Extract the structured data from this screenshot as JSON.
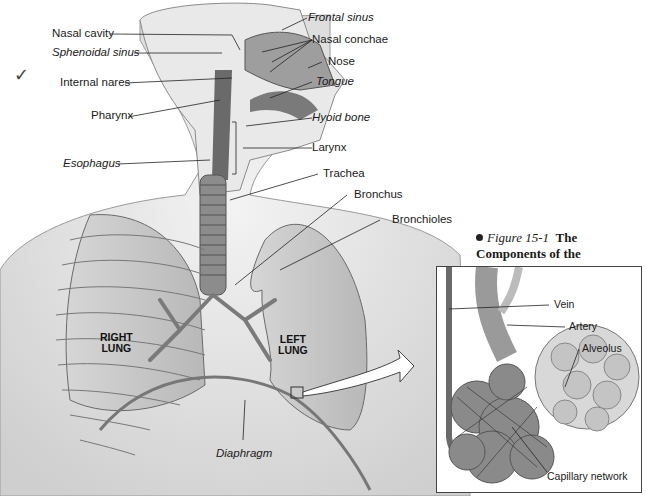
{
  "figure": {
    "bullet": "•",
    "number": "Figure 15-1",
    "title": "The Components of the Respiratory System"
  },
  "annotation": {
    "check_mark": "✓"
  },
  "labels_left": [
    {
      "id": "nasal-cavity",
      "text": "Nasal cavity",
      "italic": false
    },
    {
      "id": "sphenoidal-sinus",
      "text": "Sphenoidal sinus",
      "italic": true
    },
    {
      "id": "internal-nares",
      "text": "Internal nares",
      "italic": false
    },
    {
      "id": "pharynx",
      "text": "Pharynx",
      "italic": false
    },
    {
      "id": "esophagus",
      "text": "Esophagus",
      "italic": true
    }
  ],
  "labels_right": [
    {
      "id": "frontal-sinus",
      "text": "Frontal sinus",
      "italic": true
    },
    {
      "id": "nasal-conchae",
      "text": "Nasal conchae",
      "italic": false
    },
    {
      "id": "nose",
      "text": "Nose",
      "italic": false
    },
    {
      "id": "tongue",
      "text": "Tongue",
      "italic": true
    },
    {
      "id": "hyoid-bone",
      "text": "Hyoid bone",
      "italic": true
    },
    {
      "id": "larynx",
      "text": "Larynx",
      "italic": false
    },
    {
      "id": "trachea",
      "text": "Trachea",
      "italic": false
    },
    {
      "id": "bronchus",
      "text": "Bronchus",
      "italic": false
    },
    {
      "id": "bronchioles",
      "text": "Bronchioles",
      "italic": false
    }
  ],
  "lungs": {
    "right": "RIGHT\nLUNG",
    "right_line1": "RIGHT",
    "right_line2": "LUNG",
    "left_line1": "LEFT",
    "left_line2": "LUNG"
  },
  "bottom_labels": {
    "diaphragm": "Diaphragm"
  },
  "inset": {
    "labels": {
      "vein": "Vein",
      "artery": "Artery",
      "alveolus": "Alveolus",
      "capillary_network": "Capillary network"
    }
  },
  "colors": {
    "skin": "#e4e4e4",
    "airway": "#6a6a6a",
    "lung": "#c9c9c9",
    "line": "#222222"
  }
}
